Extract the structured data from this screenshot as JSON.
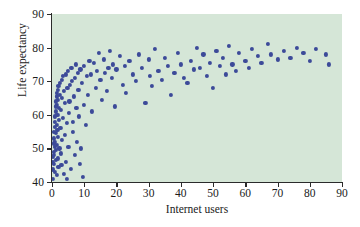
{
  "chart_data": {
    "type": "scatter",
    "title": "",
    "xlabel": "Internet users",
    "ylabel": "Life expectancy",
    "xlim": [
      0,
      90
    ],
    "ylim": [
      40,
      90
    ],
    "xticks": [
      0,
      10,
      20,
      30,
      40,
      50,
      60,
      70,
      80,
      90
    ],
    "yticks": [
      40,
      50,
      60,
      70,
      80,
      90
    ],
    "grid": false,
    "legend": null,
    "plot_background_color": "#d5e6d7",
    "marker_color": "#3c4a99",
    "axis_color": "#2b2b2b",
    "series": [
      {
        "name": "countries",
        "points": [
          [
            0.2,
            41.0
          ],
          [
            0.3,
            43.5
          ],
          [
            0.3,
            46.0
          ],
          [
            0.4,
            47.5
          ],
          [
            0.4,
            44.0
          ],
          [
            0.5,
            49.0
          ],
          [
            0.5,
            51.5
          ],
          [
            0.6,
            53.0
          ],
          [
            0.6,
            45.5
          ],
          [
            0.7,
            55.0
          ],
          [
            0.7,
            48.0
          ],
          [
            0.8,
            56.5
          ],
          [
            0.8,
            50.5
          ],
          [
            0.9,
            58.0
          ],
          [
            0.9,
            43.0
          ],
          [
            1.0,
            59.5
          ],
          [
            1.0,
            52.0
          ],
          [
            1.1,
            61.0
          ],
          [
            1.1,
            46.5
          ],
          [
            1.2,
            62.5
          ],
          [
            1.2,
            54.5
          ],
          [
            1.3,
            64.0
          ],
          [
            1.3,
            49.5
          ],
          [
            1.4,
            65.5
          ],
          [
            1.4,
            57.0
          ],
          [
            1.5,
            66.5
          ],
          [
            1.5,
            42.0
          ],
          [
            1.6,
            63.0
          ],
          [
            1.6,
            51.0
          ],
          [
            1.7,
            60.0
          ],
          [
            1.7,
            55.5
          ],
          [
            1.8,
            67.5
          ],
          [
            1.8,
            47.0
          ],
          [
            1.9,
            64.5
          ],
          [
            1.9,
            53.5
          ],
          [
            2.0,
            68.5
          ],
          [
            2.0,
            44.5
          ],
          [
            2.1,
            62.0
          ],
          [
            2.2,
            58.5
          ],
          [
            2.3,
            50.0
          ],
          [
            2.4,
            66.0
          ],
          [
            2.5,
            69.5
          ],
          [
            2.6,
            56.0
          ],
          [
            2.7,
            48.5
          ],
          [
            2.8,
            61.5
          ],
          [
            2.9,
            45.0
          ],
          [
            3.0,
            70.5
          ],
          [
            3.1,
            65.0
          ],
          [
            3.2,
            52.5
          ],
          [
            3.3,
            59.0
          ],
          [
            3.5,
            71.5
          ],
          [
            3.6,
            42.5
          ],
          [
            3.8,
            67.0
          ],
          [
            4.0,
            63.5
          ],
          [
            4.1,
            54.0
          ],
          [
            4.2,
            46.0
          ],
          [
            4.4,
            72.0
          ],
          [
            4.5,
            57.5
          ],
          [
            4.6,
            40.8
          ],
          [
            4.8,
            68.0
          ],
          [
            5.0,
            73.0
          ],
          [
            5.1,
            50.5
          ],
          [
            5.2,
            60.5
          ],
          [
            5.4,
            64.0
          ],
          [
            5.6,
            69.0
          ],
          [
            5.8,
            44.0
          ],
          [
            6.0,
            74.0
          ],
          [
            6.2,
            70.0
          ],
          [
            6.4,
            55.0
          ],
          [
            6.6,
            58.0
          ],
          [
            6.8,
            65.5
          ],
          [
            7.0,
            71.0
          ],
          [
            7.2,
            48.0
          ],
          [
            7.4,
            75.0
          ],
          [
            7.6,
            62.0
          ],
          [
            7.8,
            52.0
          ],
          [
            8.0,
            72.5
          ],
          [
            8.2,
            67.5
          ],
          [
            8.4,
            59.5
          ],
          [
            8.6,
            45.5
          ],
          [
            8.8,
            73.5
          ],
          [
            9.0,
            50.0
          ],
          [
            9.3,
            69.5
          ],
          [
            9.6,
            41.5
          ],
          [
            9.8,
            63.0
          ],
          [
            10.0,
            74.5
          ],
          [
            10.4,
            57.0
          ],
          [
            10.8,
            71.5
          ],
          [
            11.2,
            66.0
          ],
          [
            11.6,
            76.0
          ],
          [
            12.0,
            72.0
          ],
          [
            12.5,
            61.0
          ],
          [
            13.0,
            75.5
          ],
          [
            13.5,
            68.0
          ],
          [
            14.0,
            73.0
          ],
          [
            14.5,
            78.5
          ],
          [
            15.0,
            70.5
          ],
          [
            15.5,
            64.5
          ],
          [
            16.0,
            76.5
          ],
          [
            16.5,
            72.5
          ],
          [
            17.0,
            67.0
          ],
          [
            17.5,
            74.0
          ],
          [
            18.0,
            79.0
          ],
          [
            18.5,
            71.0
          ],
          [
            19.0,
            75.0
          ],
          [
            19.5,
            62.5
          ],
          [
            20.0,
            73.5
          ],
          [
            21.0,
            77.5
          ],
          [
            22.0,
            69.0
          ],
          [
            22.5,
            74.5
          ],
          [
            23.0,
            66.5
          ],
          [
            24.0,
            76.0
          ],
          [
            25.0,
            72.0
          ],
          [
            26.0,
            70.0
          ],
          [
            27.0,
            78.0
          ],
          [
            28.0,
            74.0
          ],
          [
            29.0,
            63.5
          ],
          [
            30.0,
            76.5
          ],
          [
            30.5,
            71.5
          ],
          [
            31.0,
            68.5
          ],
          [
            32.0,
            79.5
          ],
          [
            33.0,
            73.0
          ],
          [
            34.0,
            70.5
          ],
          [
            35.0,
            77.0
          ],
          [
            36.0,
            74.5
          ],
          [
            37.0,
            66.0
          ],
          [
            38.0,
            72.5
          ],
          [
            39.0,
            78.5
          ],
          [
            40.0,
            75.0
          ],
          [
            41.0,
            71.0
          ],
          [
            42.0,
            69.5
          ],
          [
            43.0,
            76.0
          ],
          [
            44.0,
            73.5
          ],
          [
            45.0,
            80.0
          ],
          [
            46.0,
            74.0
          ],
          [
            47.0,
            78.0
          ],
          [
            48.0,
            71.5
          ],
          [
            49.0,
            75.5
          ],
          [
            50.0,
            68.0
          ],
          [
            51.0,
            79.0
          ],
          [
            52.0,
            74.5
          ],
          [
            53.0,
            77.0
          ],
          [
            54.0,
            72.0
          ],
          [
            55.0,
            80.5
          ],
          [
            56.0,
            75.0
          ],
          [
            57.0,
            73.0
          ],
          [
            58.0,
            78.5
          ],
          [
            60.0,
            76.0
          ],
          [
            61.0,
            74.0
          ],
          [
            62.0,
            79.5
          ],
          [
            64.0,
            77.5
          ],
          [
            65.0,
            75.5
          ],
          [
            67.0,
            81.0
          ],
          [
            68.0,
            78.0
          ],
          [
            70.0,
            76.5
          ],
          [
            72.0,
            79.0
          ],
          [
            74.0,
            77.0
          ],
          [
            76.0,
            80.0
          ],
          [
            78.0,
            78.5
          ],
          [
            80.0,
            76.0
          ],
          [
            82.0,
            79.5
          ],
          [
            85.0,
            78.0
          ],
          [
            86.0,
            75.0
          ]
        ]
      }
    ]
  }
}
